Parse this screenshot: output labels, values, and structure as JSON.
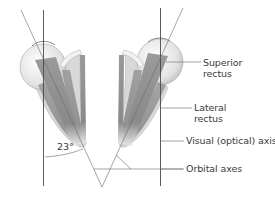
{
  "figure": {
    "angle_label": "23°",
    "labels": {
      "superior_rectus": "Superior\nrectus",
      "lateral_rectus": "Lateral\nrectus",
      "visual_axis": "Visual (optical) axis",
      "orbital_axes": "Orbital axes"
    },
    "colors": {
      "line": "#4a4a4a",
      "muscle": "#8c8c8c",
      "eye": "#e6e6e6",
      "text": "#3a3a3a"
    }
  }
}
